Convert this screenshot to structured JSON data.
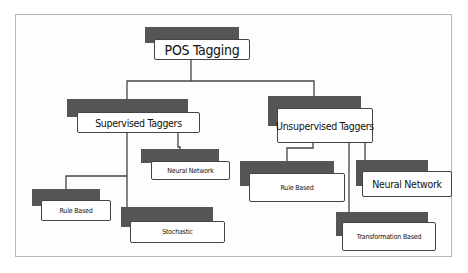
{
  "diagram": {
    "type": "tree",
    "root": {
      "id": "pos-tagging",
      "label": "POS Tagging",
      "children": [
        {
          "id": "supervised",
          "label": "Supervised Taggers",
          "children": [
            {
              "id": "sup-neural",
              "label": "Neural Network"
            },
            {
              "id": "sup-rule",
              "label": "Rule Based"
            },
            {
              "id": "sup-stochastic",
              "label": "Stochastic"
            }
          ]
        },
        {
          "id": "unsupervised",
          "label": "Unsupervised Taggers",
          "children": [
            {
              "id": "unsup-rule",
              "label": "Rule Based"
            },
            {
              "id": "unsup-neural",
              "label": "Neural Network"
            },
            {
              "id": "unsup-transformation",
              "label": "Transformation Based"
            }
          ]
        }
      ]
    },
    "colors": {
      "shadow": "#555555",
      "box_fill": "#ffffff",
      "box_border": "#444444",
      "connector": "#444444",
      "frame_border": "#b8b8b8"
    }
  },
  "labels": {
    "root": "POS Tagging",
    "supervised": "Supervised Taggers",
    "unsupervised": "Unsupervised Taggers",
    "sup_neural": "Neural Network",
    "sup_rule": "Rule Based",
    "sup_stochastic": "Stochastic",
    "unsup_rule": "Rule Based",
    "unsup_neural": "Neural Network",
    "unsup_transformation": "Transformation Based"
  }
}
